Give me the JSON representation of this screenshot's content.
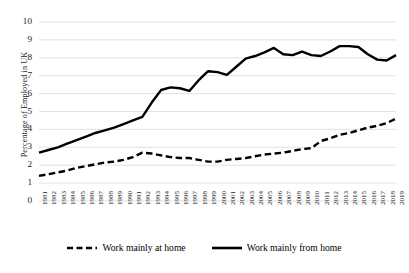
{
  "chart_data": {
    "type": "line",
    "title": "",
    "xlabel": "",
    "ylabel": "Percentage of Employed in UK",
    "ylim": [
      0,
      10
    ],
    "yticks": [
      0,
      1,
      2,
      3,
      4,
      5,
      6,
      7,
      8,
      9,
      10
    ],
    "grid": true,
    "legend_position": "bottom",
    "categories": [
      "1981",
      "1982",
      "1983",
      "1984",
      "1985",
      "1986",
      "1987",
      "1988",
      "1989",
      "1990",
      "1991",
      "1992",
      "1993",
      "1994",
      "1995",
      "1996",
      "1997",
      "1998",
      "1999",
      "2000",
      "2001",
      "2002",
      "2003",
      "2004",
      "2005",
      "2006",
      "2007",
      "2008",
      "2009",
      "2010",
      "2011",
      "2012",
      "2013",
      "2014",
      "2015",
      "2016",
      "2017",
      "2018",
      "2019"
    ],
    "series": [
      {
        "name": "Work mainly at home",
        "style": "dashed",
        "color": "#000000",
        "values": [
          1.4,
          1.5,
          1.6,
          1.7,
          1.85,
          1.95,
          2.05,
          2.15,
          2.2,
          2.3,
          2.45,
          2.7,
          2.65,
          2.55,
          2.45,
          2.4,
          2.4,
          2.3,
          2.2,
          2.2,
          2.3,
          2.35,
          2.4,
          2.5,
          2.6,
          2.65,
          2.7,
          2.8,
          2.9,
          2.95,
          3.35,
          3.5,
          3.7,
          3.8,
          3.95,
          4.1,
          4.2,
          4.35,
          4.6
        ]
      },
      {
        "name": "Work mainly from home",
        "style": "solid",
        "color": "#000000",
        "values": [
          2.7,
          2.85,
          3.0,
          3.2,
          3.4,
          3.6,
          3.8,
          3.95,
          4.1,
          4.3,
          4.5,
          4.7,
          5.5,
          6.2,
          6.35,
          6.3,
          6.15,
          6.75,
          7.25,
          7.2,
          7.05,
          7.5,
          7.95,
          8.1,
          8.3,
          8.55,
          8.2,
          8.15,
          8.35,
          8.15,
          8.1,
          8.35,
          8.65,
          8.65,
          8.6,
          8.2,
          7.9,
          7.85,
          8.15
        ]
      }
    ]
  },
  "legend": {
    "items": [
      {
        "label": "Work mainly at home",
        "style": "dashed"
      },
      {
        "label": "Work mainly from home",
        "style": "solid"
      }
    ]
  }
}
